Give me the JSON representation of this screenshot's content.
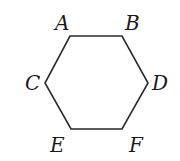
{
  "diagram": {
    "type": "hexagon",
    "stroke_color": "#2a2a2a",
    "vertices": [
      {
        "label": "A",
        "x": 70,
        "y": 36,
        "lx": 55,
        "ly": 30
      },
      {
        "label": "B",
        "x": 122,
        "y": 36,
        "lx": 125,
        "ly": 30
      },
      {
        "label": "D",
        "x": 148,
        "y": 83,
        "lx": 152,
        "ly": 90
      },
      {
        "label": "F",
        "x": 122,
        "y": 129,
        "lx": 129,
        "ly": 152
      },
      {
        "label": "E",
        "x": 71,
        "y": 129,
        "lx": 50,
        "ly": 152
      },
      {
        "label": "C",
        "x": 45,
        "y": 83,
        "lx": 25,
        "ly": 90
      }
    ]
  }
}
